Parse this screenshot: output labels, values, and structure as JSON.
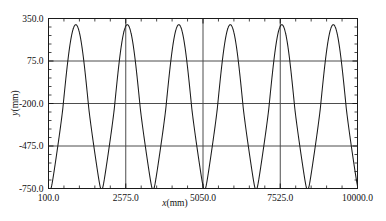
{
  "chart_data": {
    "type": "line",
    "title": "",
    "xlabel": "x(mm)",
    "ylabel": "y(mm)",
    "xlim": [
      100.0,
      10000.0
    ],
    "ylim": [
      -750.0,
      350.0
    ],
    "grid": true,
    "legend": "none",
    "x_ticks": [
      "100.0",
      "2575.0",
      "5050.0",
      "7525.0",
      "10000.0"
    ],
    "x_tick_values": [
      100.0,
      2575.0,
      5050.0,
      7525.0,
      10000.0
    ],
    "y_ticks": [
      "350.0",
      "75.0",
      "-200.0",
      "-475.0",
      "-750.0"
    ],
    "y_tick_values": [
      350.0,
      75.0,
      -200.0,
      -475.0,
      -750.0
    ],
    "x_minor_ticks_per_interval": 5,
    "y_minor_ticks_per_interval": 5,
    "series": [
      {
        "name": "trajectory",
        "color": "#1a1a1a",
        "description": "Self-intersecting oscillatory trajectory: six narrow downward loops alternating with six broad upper arcs",
        "loop_count": 6,
        "arc_peak_y": 310,
        "loop_trough_y": -760,
        "crossing_y": -60,
        "loop_half_width_x": 115,
        "period_x": 1650,
        "first_arc_peak_x": 975,
        "first_loop_center_x": 1800,
        "x_start": 100.0,
        "x_end": 10000.0,
        "y_at_x_start": 300,
        "y_at_x_end": 215
      }
    ]
  },
  "axis_titles": {
    "x_var": "x",
    "x_unit": "(mm)",
    "y_var": "y",
    "y_unit": "(mm)"
  },
  "colors": {
    "frame": "#1a1a1a",
    "grid": "#4d4d4d",
    "curve": "#1a1a1a",
    "background": "#ffffff",
    "text": "#111111"
  }
}
